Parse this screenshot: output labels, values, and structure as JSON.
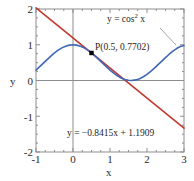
{
  "chart_data": {
    "type": "line",
    "title": "",
    "xlabel": "x",
    "ylabel": "y",
    "xlim": [
      -1,
      3
    ],
    "ylim": [
      -2,
      2
    ],
    "grid": false,
    "legend_position": "inline-annotations",
    "x_ticks": [
      "-1",
      "0",
      "1",
      "2",
      "3"
    ],
    "x_tick_values": [
      -1,
      0,
      1,
      2,
      3
    ],
    "y_ticks": [
      "2",
      "1",
      "0",
      "-1",
      "-2"
    ],
    "y_tick_values": [
      2,
      1,
      0,
      -1,
      -2
    ],
    "x_minor_tick_step": 0.25,
    "y_minor_tick_step": 0.25,
    "series": [
      {
        "name": "y = cos^2 x",
        "label_text": "y = cos",
        "label_sup": "2",
        "label_tail": " x",
        "color": "#3f67b5",
        "type": "curve",
        "formula": "cos(x)^2",
        "x": [
          -1,
          -0.9,
          -0.8,
          -0.7,
          -0.6,
          -0.5,
          -0.4,
          -0.3,
          -0.2,
          -0.1,
          0,
          0.1,
          0.2,
          0.3,
          0.4,
          0.5,
          0.6,
          0.7,
          0.8,
          0.9,
          1,
          1.1,
          1.2,
          1.3,
          1.4,
          1.5,
          1.5708,
          1.7,
          1.8,
          1.9,
          2,
          2.1,
          2.2,
          2.3,
          2.4,
          2.5,
          2.6,
          2.7,
          2.8,
          2.9,
          3
        ],
        "y": [
          0.2919,
          0.3861,
          0.4855,
          0.5849,
          0.6796,
          0.7702,
          0.8484,
          0.9131,
          0.9605,
          0.99,
          1.0,
          0.99,
          0.9605,
          0.9131,
          0.8484,
          0.7702,
          0.6796,
          0.5849,
          0.4855,
          0.3861,
          0.2919,
          0.2056,
          0.1313,
          0.0715,
          0.0289,
          0.005,
          0.0,
          0.0171,
          0.051,
          0.1045,
          0.1732,
          0.2562,
          0.3459,
          0.4437,
          0.5412,
          0.6418,
          0.7352,
          0.8216,
          0.8938,
          0.9512,
          0.98
        ]
      },
      {
        "name": "y = -0.8415x + 1.1909",
        "label_text": "y = −0.8415x + 1.1909",
        "color": "#c0392f",
        "type": "line",
        "slope": -0.8415,
        "intercept": 1.1909,
        "x": [
          -1,
          3
        ],
        "y": [
          2.0324,
          -1.3336
        ]
      }
    ],
    "points": [
      {
        "name": "P",
        "label": "P(0.5, 0.7702)",
        "x": 0.5,
        "y": 0.7702,
        "color": "#000000",
        "marker": "square"
      }
    ],
    "annotations": [
      {
        "name": "cos-squared-label",
        "has_leader_line": true
      },
      {
        "name": "tangent-equation-label",
        "has_leader_line": false
      }
    ],
    "colors": {
      "curve": "#3f67b5",
      "tangent": "#c0392f",
      "frame": "#8d8d8d",
      "axis": "#8d8d8d",
      "text": "#1e1e1e",
      "background": "#ffffff",
      "point": "#000000",
      "leader": "#8d8d8d"
    }
  }
}
